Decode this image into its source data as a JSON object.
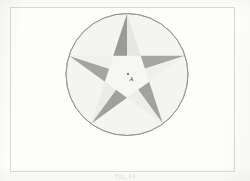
{
  "page": {
    "background_color": "#fdfdfc",
    "width": 250,
    "height": 181
  },
  "frame": {
    "name": "figure-border",
    "stroke_color": "#d6d6d4",
    "x": 10,
    "y": 7,
    "width": 225,
    "height": 165
  },
  "caption": {
    "text": "Fig. 14",
    "color": "#d8d8d6"
  },
  "center_annotation": {
    "dot_label": "",
    "glyph_label": "A",
    "dot_color": "#555553",
    "glyph_color": "#3b3b39"
  },
  "chart_data": {
    "type": "diagram",
    "subtitle": "",
    "xlabel": "",
    "ylabel": "",
    "shapes": [
      {
        "name": "circumscribed-circle",
        "kind": "circle",
        "center_x": 127,
        "center_y": 74.5,
        "radius": 61,
        "stroke": "#8f8f8d",
        "stroke_width": 0.9,
        "fill": "#f4f4f2"
      },
      {
        "name": "pentagram-star",
        "kind": "star",
        "points": 5,
        "outer_radius": 61,
        "inner_radius": 23.3,
        "rotation_deg": -90,
        "center_x": 127,
        "center_y": 74.5
      }
    ],
    "facets": [
      {
        "name": "point-top-left-facet",
        "shade": "dark",
        "fill": "#9a9a98"
      },
      {
        "name": "point-top-right-facet",
        "shade": "light",
        "fill": "#e6e6e3"
      },
      {
        "name": "point-upper-right-left-facet",
        "shade": "dark",
        "fill": "#a6a6a3"
      },
      {
        "name": "point-upper-right-right-facet",
        "shade": "light",
        "fill": "#efefed"
      },
      {
        "name": "point-lower-right-left-facet",
        "shade": "dark",
        "fill": "#a2a2a0"
      },
      {
        "name": "point-lower-right-right-facet",
        "shade": "light",
        "fill": "#ededea"
      },
      {
        "name": "point-lower-left-left-facet",
        "shade": "dark",
        "fill": "#a0a09e"
      },
      {
        "name": "point-lower-left-right-facet",
        "shade": "light",
        "fill": "#ebebe8"
      },
      {
        "name": "point-upper-left-left-facet",
        "shade": "dark",
        "fill": "#a4a4a1"
      },
      {
        "name": "point-upper-left-right-facet",
        "shade": "light",
        "fill": "#f0f0ee"
      },
      {
        "name": "inner-pentagon",
        "shade": "light",
        "fill": "#f6f6f4"
      }
    ],
    "colors": {
      "circle_fill": "#f4f4f2",
      "circle_stroke": "#8f8f8d",
      "facet_dark": "#9d9d9b",
      "facet_light": "#ededea",
      "pentagon_fill": "#f6f6f4",
      "paper": "#fdfdfc",
      "frame": "#d6d6d4"
    },
    "grid": false,
    "legend": null,
    "annotations": [
      {
        "name": "center-mark-dot",
        "x": 127,
        "y": 73.5,
        "text": ""
      },
      {
        "name": "center-mark-glyph",
        "x": 130,
        "y": 77,
        "text": "A"
      }
    ]
  }
}
